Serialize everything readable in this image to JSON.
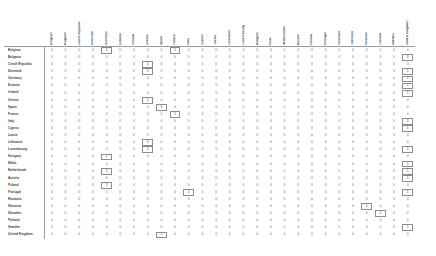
{
  "table": {
    "name": "eu-member-state-adjacency-matrix",
    "row_header_label": "",
    "countries": [
      "Belgium",
      "Bulgaria",
      "Czech Republic",
      "Denmark",
      "Germany",
      "Estonia",
      "Ireland",
      "Greece",
      "Spain",
      "France",
      "Italy",
      "Cyprus",
      "Latvia",
      "Lithuania",
      "Luxembourg",
      "Hungary",
      "Malta",
      "Netherlands",
      "Austria",
      "Poland",
      "Portugal",
      "Romania",
      "Slovenia",
      "Slovakia",
      "Finland",
      "Sweden",
      "United Kingdom"
    ],
    "column_headers": [
      "Belgium",
      "Bulgaria",
      "Czech Republic",
      "Denmark",
      "Germany",
      "Estonia",
      "Ireland",
      "Greece",
      "Spain",
      "France",
      "Italy",
      "Cyprus",
      "Latvia",
      "Lithuania",
      "Luxembourg",
      "Hungary",
      "Malta",
      "Netherlands",
      "Austria",
      "Poland",
      "Portugal",
      "Romania",
      "Slovenia",
      "Slovakia",
      "Finland",
      "Sweden",
      "United Kingdom"
    ],
    "rows": [
      {
        "label": "Belgium",
        "values": [
          0,
          0,
          0,
          0,
          1,
          0,
          0,
          0,
          0,
          1,
          0,
          0,
          0,
          0,
          0,
          0,
          0,
          0,
          0,
          0,
          0,
          0,
          0,
          0,
          0,
          0,
          0
        ],
        "boxed": [
          4,
          9
        ]
      },
      {
        "label": "Bulgaria",
        "values": [
          0,
          0,
          0,
          0,
          0,
          0,
          0,
          0,
          0,
          0,
          0,
          0,
          0,
          0,
          0,
          0,
          0,
          0,
          0,
          0,
          0,
          0,
          0,
          0,
          0,
          0,
          1
        ],
        "boxed": [
          26
        ]
      },
      {
        "label": "Czech Republic",
        "values": [
          0,
          0,
          0,
          0,
          0,
          0,
          0,
          1,
          0,
          0,
          0,
          0,
          0,
          0,
          0,
          0,
          0,
          0,
          0,
          0,
          0,
          0,
          0,
          0,
          0,
          0,
          0
        ],
        "boxed": [
          7
        ]
      },
      {
        "label": "Denmark",
        "values": [
          0,
          0,
          0,
          0,
          0,
          0,
          0,
          1,
          0,
          0,
          0,
          0,
          0,
          0,
          0,
          0,
          0,
          0,
          0,
          0,
          0,
          0,
          0,
          0,
          0,
          0,
          1
        ],
        "boxed": [
          7,
          26
        ]
      },
      {
        "label": "Germany",
        "values": [
          0,
          0,
          0,
          0,
          0,
          0,
          0,
          0,
          0,
          0,
          0,
          0,
          0,
          0,
          0,
          0,
          0,
          0,
          0,
          0,
          0,
          0,
          0,
          0,
          0,
          0,
          1
        ],
        "boxed": [
          26
        ]
      },
      {
        "label": "Estonia",
        "values": [
          0,
          0,
          0,
          0,
          0,
          0,
          0,
          0,
          0,
          0,
          0,
          0,
          0,
          0,
          0,
          0,
          0,
          0,
          0,
          0,
          0,
          0,
          0,
          0,
          0,
          0,
          1
        ],
        "boxed": [
          26
        ]
      },
      {
        "label": "Ireland",
        "values": [
          0,
          0,
          0,
          0,
          0,
          0,
          0,
          0,
          0,
          0,
          0,
          0,
          0,
          0,
          0,
          0,
          0,
          0,
          0,
          0,
          0,
          0,
          0,
          0,
          0,
          0,
          1
        ],
        "boxed": [
          26
        ]
      },
      {
        "label": "Greece",
        "values": [
          0,
          0,
          0,
          0,
          0,
          0,
          0,
          1,
          0,
          0,
          0,
          0,
          0,
          0,
          0,
          0,
          0,
          0,
          0,
          0,
          0,
          0,
          0,
          0,
          0,
          0,
          0
        ],
        "boxed": [
          7
        ]
      },
      {
        "label": "Spain",
        "values": [
          0,
          0,
          0,
          0,
          0,
          0,
          0,
          0,
          1,
          0,
          0,
          0,
          0,
          0,
          0,
          0,
          0,
          0,
          0,
          0,
          0,
          0,
          0,
          0,
          0,
          0,
          0
        ],
        "boxed": [
          8
        ]
      },
      {
        "label": "France",
        "values": [
          0,
          0,
          0,
          0,
          0,
          0,
          0,
          0,
          0,
          1,
          0,
          0,
          0,
          0,
          0,
          0,
          0,
          0,
          0,
          0,
          0,
          0,
          0,
          0,
          0,
          0,
          0
        ],
        "boxed": [
          9
        ]
      },
      {
        "label": "Italy",
        "values": [
          0,
          0,
          0,
          0,
          0,
          0,
          0,
          0,
          0,
          0,
          0,
          0,
          0,
          0,
          0,
          0,
          0,
          0,
          0,
          0,
          0,
          0,
          0,
          0,
          0,
          0,
          1
        ],
        "boxed": [
          26
        ]
      },
      {
        "label": "Cyprus",
        "values": [
          0,
          0,
          0,
          0,
          0,
          0,
          0,
          0,
          0,
          0,
          0,
          0,
          0,
          0,
          0,
          0,
          0,
          0,
          0,
          0,
          0,
          0,
          0,
          0,
          0,
          0,
          1
        ],
        "boxed": [
          26
        ]
      },
      {
        "label": "Latvia",
        "values": [
          0,
          0,
          0,
          0,
          0,
          0,
          0,
          0,
          0,
          0,
          0,
          0,
          0,
          0,
          0,
          0,
          0,
          0,
          0,
          0,
          0,
          0,
          0,
          0,
          0,
          0,
          0
        ],
        "boxed": []
      },
      {
        "label": "Lithuania",
        "values": [
          0,
          0,
          0,
          0,
          0,
          0,
          0,
          1,
          0,
          0,
          0,
          0,
          0,
          0,
          0,
          0,
          0,
          0,
          0,
          0,
          0,
          0,
          0,
          0,
          0,
          0,
          0
        ],
        "boxed": [
          7
        ]
      },
      {
        "label": "Luxembourg",
        "values": [
          0,
          0,
          0,
          0,
          0,
          0,
          0,
          1,
          0,
          0,
          0,
          0,
          0,
          0,
          0,
          0,
          0,
          0,
          0,
          0,
          0,
          0,
          0,
          0,
          0,
          0,
          1
        ],
        "boxed": [
          7,
          26
        ]
      },
      {
        "label": "Hungary",
        "values": [
          0,
          0,
          0,
          0,
          1,
          0,
          0,
          0,
          0,
          0,
          0,
          0,
          0,
          0,
          0,
          0,
          0,
          0,
          0,
          0,
          0,
          0,
          0,
          0,
          0,
          0,
          0
        ],
        "boxed": [
          4
        ]
      },
      {
        "label": "Malta",
        "values": [
          0,
          0,
          0,
          0,
          0,
          0,
          0,
          0,
          0,
          0,
          0,
          0,
          0,
          0,
          0,
          0,
          0,
          0,
          0,
          0,
          0,
          0,
          0,
          0,
          0,
          0,
          1
        ],
        "boxed": [
          26
        ]
      },
      {
        "label": "Netherlands",
        "values": [
          0,
          0,
          0,
          0,
          1,
          0,
          0,
          0,
          0,
          0,
          0,
          0,
          0,
          0,
          0,
          0,
          0,
          0,
          0,
          0,
          0,
          0,
          0,
          0,
          0,
          0,
          1
        ],
        "boxed": [
          4,
          26
        ]
      },
      {
        "label": "Austria",
        "values": [
          0,
          0,
          0,
          0,
          0,
          0,
          0,
          0,
          0,
          0,
          0,
          0,
          0,
          0,
          0,
          0,
          0,
          0,
          0,
          0,
          0,
          0,
          0,
          0,
          0,
          0,
          1
        ],
        "boxed": [
          26
        ]
      },
      {
        "label": "Poland",
        "values": [
          0,
          0,
          0,
          0,
          1,
          0,
          0,
          0,
          0,
          0,
          0,
          0,
          0,
          0,
          0,
          0,
          0,
          0,
          0,
          0,
          0,
          0,
          0,
          0,
          0,
          0,
          0
        ],
        "boxed": [
          4
        ]
      },
      {
        "label": "Portugal",
        "values": [
          0,
          0,
          0,
          0,
          0,
          0,
          0,
          0,
          0,
          0,
          1,
          0,
          0,
          0,
          0,
          0,
          0,
          0,
          0,
          0,
          0,
          0,
          0,
          0,
          0,
          0,
          1
        ],
        "boxed": [
          10,
          26
        ]
      },
      {
        "label": "Romania",
        "values": [
          0,
          0,
          0,
          0,
          0,
          0,
          0,
          0,
          0,
          0,
          0,
          0,
          0,
          0,
          0,
          0,
          0,
          0,
          0,
          0,
          0,
          0,
          0,
          0,
          0,
          0,
          0
        ],
        "boxed": []
      },
      {
        "label": "Slovenia",
        "values": [
          0,
          0,
          0,
          0,
          0,
          0,
          0,
          0,
          0,
          0,
          0,
          0,
          0,
          0,
          0,
          0,
          0,
          0,
          0,
          0,
          0,
          0,
          0,
          1,
          0,
          0,
          0
        ],
        "boxed": [
          23
        ]
      },
      {
        "label": "Slovakia",
        "values": [
          0,
          0,
          0,
          0,
          0,
          0,
          0,
          0,
          0,
          0,
          0,
          0,
          0,
          0,
          0,
          0,
          0,
          0,
          0,
          0,
          0,
          0,
          0,
          0,
          1,
          0,
          0
        ],
        "boxed": [
          24
        ]
      },
      {
        "label": "Finland",
        "values": [
          0,
          0,
          0,
          0,
          0,
          0,
          0,
          0,
          0,
          0,
          0,
          0,
          0,
          0,
          0,
          0,
          0,
          0,
          0,
          0,
          0,
          0,
          0,
          0,
          0,
          0,
          0
        ],
        "boxed": []
      },
      {
        "label": "Sweden",
        "values": [
          0,
          0,
          0,
          0,
          0,
          0,
          0,
          0,
          0,
          0,
          0,
          0,
          0,
          0,
          0,
          0,
          0,
          0,
          0,
          0,
          0,
          0,
          0,
          0,
          0,
          0,
          1
        ],
        "boxed": [
          26
        ]
      },
      {
        "label": "United Kingdom",
        "values": [
          0,
          0,
          0,
          0,
          0,
          0,
          0,
          0,
          1,
          0,
          0,
          0,
          0,
          0,
          0,
          0,
          0,
          0,
          0,
          0,
          0,
          0,
          0,
          0,
          0,
          0,
          0
        ],
        "boxed": [
          8
        ]
      }
    ]
  },
  "style": {
    "grid_line_color": "#9a9a9a",
    "box_outline_color": "#8d8d8d",
    "text_color": "#4a4a4a",
    "value_color": "#6d6d6d",
    "background": "#ffffff"
  }
}
